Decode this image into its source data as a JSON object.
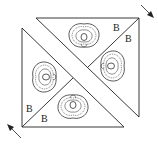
{
  "diagram": {
    "labels": [
      "B",
      "B",
      "B",
      "B"
    ],
    "arrows": [
      "arrow-top-right",
      "arrow-bottom-left"
    ],
    "motif": "lace-flower-motif"
  }
}
